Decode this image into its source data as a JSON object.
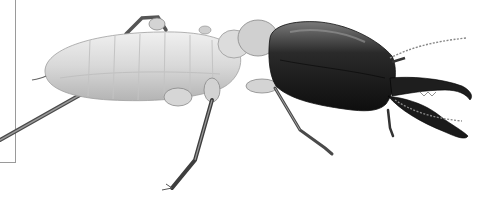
{
  "image": {
    "subject": "soldier termite illustration",
    "width": 501,
    "height": 209,
    "background": "#ffffff",
    "colors": {
      "abdomen_light": "#e6e6e6",
      "abdomen_mid": "#c8c8c8",
      "abdomen_shade": "#a8a8a8",
      "head_dark": "#1c1c1c",
      "head_highlight": "#6a6a6a",
      "leg": "#5a5a5a",
      "frame": "#9a9a9a"
    }
  }
}
